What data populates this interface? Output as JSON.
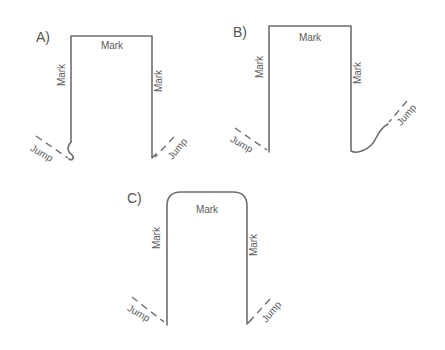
{
  "diagram": {
    "panels": [
      {
        "id": "A",
        "label": "A)",
        "mark_top": "Mark",
        "mark_left": "Mark",
        "mark_right": "Mark",
        "jump_left": "Jump",
        "jump_right": "Jump",
        "corner_style": "square",
        "left_end": "curl",
        "right_end": "straight"
      },
      {
        "id": "B",
        "label": "B)",
        "mark_top": "Mark",
        "mark_left": "Mark",
        "mark_right": "Mark",
        "jump_left": "Jump",
        "jump_right": "Jump",
        "corner_style": "square",
        "left_end": "straight",
        "right_end": "curve-up"
      },
      {
        "id": "C",
        "label": "C)",
        "mark_top": "Mark",
        "mark_left": "Mark",
        "mark_right": "Mark",
        "jump_left": "Jump",
        "jump_right": "Jump",
        "corner_style": "rounded",
        "left_end": "straight",
        "right_end": "straight"
      }
    ],
    "colors": {
      "line": "#6e6e6e",
      "text": "#5a5a5a",
      "background": "#ffffff"
    }
  }
}
